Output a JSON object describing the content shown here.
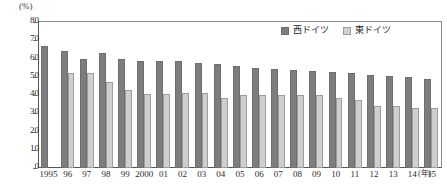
{
  "chart_data": {
    "type": "bar",
    "title": "",
    "xlabel": "(年)",
    "ylabel": "(%)",
    "ylim": [
      0,
      80
    ],
    "ytick_step": 10,
    "yticks": [
      80,
      70,
      60,
      50,
      40,
      30,
      20,
      10,
      0
    ],
    "grid": false,
    "legend_position": "top-right",
    "categories": [
      "1995",
      "96",
      "97",
      "98",
      "99",
      "2000",
      "01",
      "02",
      "03",
      "04",
      "05",
      "06",
      "07",
      "08",
      "09",
      "10",
      "11",
      "12",
      "13",
      "14",
      "15"
    ],
    "series": [
      {
        "name": "西ドイツ",
        "color": "#7d7d7d",
        "values": [
          67,
          64,
          60,
          63,
          60,
          58.5,
          58.5,
          58.5,
          57.5,
          57,
          56,
          55,
          54,
          53.5,
          53,
          52.5,
          52,
          51,
          50.5,
          50,
          49
        ]
      },
      {
        "name": "東ドイツ",
        "color": "#cfcfcf",
        "values": [
          null,
          52,
          52,
          47,
          42.5,
          40.5,
          40.5,
          41,
          41,
          38.5,
          40,
          40,
          40,
          40,
          40,
          38.5,
          37.5,
          34,
          34,
          33,
          33
        ]
      }
    ]
  },
  "axis": {
    "unit_top": "(%)",
    "unit_right": "(年)"
  },
  "legend": {
    "items": [
      {
        "label": "西ドイツ"
      },
      {
        "label": "東ドイツ"
      }
    ]
  }
}
